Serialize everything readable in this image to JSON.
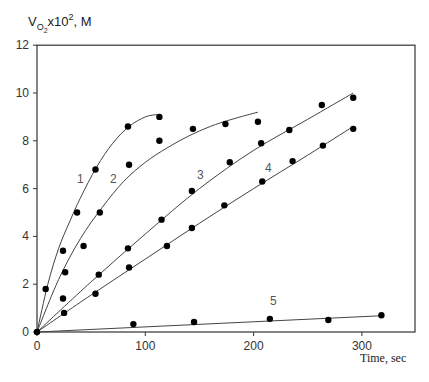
{
  "chart_data": {
    "type": "scatter",
    "title": "",
    "ylabel": "V_O2 x10^2, M",
    "ylabel_parts": {
      "main": "V",
      "sub": "O",
      "subsub": "2",
      "mid": "x10",
      "sup": "2",
      "end": ", M"
    },
    "xlabel": "Time, sec",
    "xlim": [
      0,
      350
    ],
    "ylim": [
      0,
      12
    ],
    "x_ticks": [
      0,
      100,
      200,
      300
    ],
    "y_ticks": [
      0,
      2,
      4,
      6,
      8,
      10,
      12
    ],
    "grid": false,
    "legend": "none (curves labeled inline 1-5)",
    "series": [
      {
        "name": "1",
        "label_pos": [
          77,
          183
        ],
        "points": [
          [
            8,
            1.8
          ],
          [
            24,
            3.4
          ],
          [
            37,
            5.0
          ],
          [
            54,
            6.8
          ],
          [
            84,
            8.6
          ],
          [
            113,
            9.0
          ]
        ],
        "fit": [
          [
            0,
            0
          ],
          [
            10,
            2.0
          ],
          [
            20,
            3.5
          ],
          [
            30,
            4.6
          ],
          [
            40,
            5.6
          ],
          [
            55,
            6.9
          ],
          [
            70,
            7.9
          ],
          [
            85,
            8.6
          ],
          [
            100,
            9.0
          ],
          [
            111,
            9.1
          ]
        ]
      },
      {
        "name": "2",
        "label_pos": [
          110,
          183
        ],
        "points": [
          [
            26,
            2.5
          ],
          [
            43,
            3.6
          ],
          [
            58,
            5.0
          ],
          [
            85,
            7.0
          ],
          [
            113,
            8.0
          ],
          [
            144,
            8.5
          ],
          [
            174,
            8.7
          ],
          [
            204,
            8.8
          ]
        ],
        "fit": [
          [
            0,
            0
          ],
          [
            20,
            2.2
          ],
          [
            40,
            3.9
          ],
          [
            60,
            5.2
          ],
          [
            80,
            6.3
          ],
          [
            100,
            7.1
          ],
          [
            120,
            7.7
          ],
          [
            140,
            8.2
          ],
          [
            160,
            8.6
          ],
          [
            180,
            8.9
          ],
          [
            204,
            9.2
          ]
        ]
      },
      {
        "name": "3",
        "label_pos": [
          197,
          179
        ],
        "points": [
          [
            24,
            1.4
          ],
          [
            57,
            2.4
          ],
          [
            84,
            3.5
          ],
          [
            115,
            4.7
          ],
          [
            143,
            5.9
          ],
          [
            178,
            7.1
          ],
          [
            207,
            7.9
          ],
          [
            233,
            8.45
          ],
          [
            263,
            9.5
          ],
          [
            292,
            9.8
          ]
        ],
        "fit": [
          [
            0,
            0
          ],
          [
            50,
            2.1
          ],
          [
            100,
            4.1
          ],
          [
            150,
            6.0
          ],
          [
            200,
            7.6
          ],
          [
            250,
            8.9
          ],
          [
            292,
            10.0
          ]
        ]
      },
      {
        "name": "4",
        "label_pos": [
          265,
          172
        ],
        "points": [
          [
            25,
            0.8
          ],
          [
            54,
            1.6
          ],
          [
            85,
            2.7
          ],
          [
            120,
            3.6
          ],
          [
            143,
            4.35
          ],
          [
            173,
            5.3
          ],
          [
            208,
            6.3
          ],
          [
            236,
            7.15
          ],
          [
            264,
            7.8
          ],
          [
            292,
            8.5
          ]
        ],
        "fit": [
          [
            0,
            0
          ],
          [
            50,
            1.55
          ],
          [
            100,
            3.05
          ],
          [
            150,
            4.55
          ],
          [
            200,
            6.0
          ],
          [
            250,
            7.4
          ],
          [
            292,
            8.6
          ]
        ]
      },
      {
        "name": "5",
        "label_pos": [
          270,
          305
        ],
        "points": [
          [
            89,
            0.33
          ],
          [
            145,
            0.42
          ],
          [
            215,
            0.55
          ],
          [
            269,
            0.5
          ],
          [
            318,
            0.7
          ]
        ],
        "fit": [
          [
            0,
            0
          ],
          [
            318,
            0.68
          ]
        ]
      }
    ]
  }
}
